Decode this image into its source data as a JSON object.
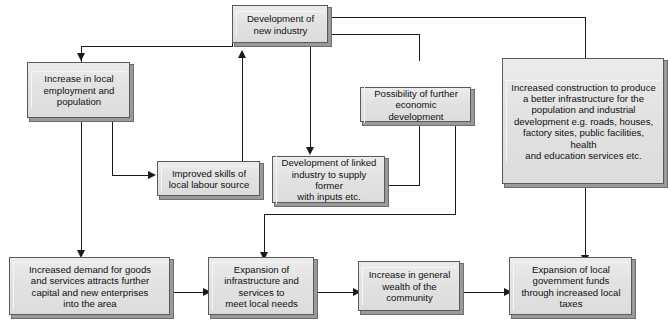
{
  "diagram": {
    "nodes": [
      {
        "id": "new-industry",
        "label": "Development of\nnew industry"
      },
      {
        "id": "local-employment",
        "label": "Increase in local\nemployment and\npopulation"
      },
      {
        "id": "improved-skills",
        "label": "Improved skills of\nlocal labour source"
      },
      {
        "id": "linked-industry",
        "label": "Development of linked\nindustry to supply former\nwith inputs etc."
      },
      {
        "id": "economic-development",
        "label": "Possibility of further\neconomic development"
      },
      {
        "id": "increased-construction",
        "label": "Increased construction to produce\na better infrastructure for the\npopulation and industrial\ndevelopment e.g. roads, houses,\nfactory sites, public facilities, health\nand education services etc."
      },
      {
        "id": "increased-demand",
        "label": "Increased demand for goods\nand services attracts further\ncapital and new enterprises\ninto the area"
      },
      {
        "id": "expansion-infrastructure",
        "label": "Expansion of\ninfrastructure and\nservices to\nmeet local needs"
      },
      {
        "id": "general-wealth",
        "label": "Increase in general\nwealth of the\ncommunity"
      },
      {
        "id": "local-government-funds",
        "label": "Expansion of local\ngovernment funds\nthrough increased local\ntaxes"
      }
    ],
    "edges": [
      {
        "from": "new-industry",
        "to": "local-employment"
      },
      {
        "from": "new-industry",
        "to": "linked-industry"
      },
      {
        "from": "new-industry",
        "to": "increased-construction"
      },
      {
        "from": "local-employment",
        "to": "improved-skills"
      },
      {
        "from": "local-employment",
        "to": "increased-demand"
      },
      {
        "from": "improved-skills",
        "to": "new-industry"
      },
      {
        "from": "linked-industry",
        "to": "economic-development"
      },
      {
        "from": "linked-industry",
        "to": "expansion-infrastructure"
      },
      {
        "from": "economic-development",
        "to": "new-industry"
      },
      {
        "from": "increased-construction",
        "to": "new-industry"
      },
      {
        "from": "increased-construction",
        "to": "local-government-funds"
      },
      {
        "from": "increased-demand",
        "to": "expansion-infrastructure"
      },
      {
        "from": "expansion-infrastructure",
        "to": "general-wealth"
      },
      {
        "from": "general-wealth",
        "to": "local-government-funds"
      }
    ],
    "colors": {
      "box_fill": "#e3e3e3",
      "box_border": "#5a5a5a",
      "box_shadow": "#9a9a9a",
      "line": "#1a1a1a",
      "background": "#ffffff"
    }
  }
}
